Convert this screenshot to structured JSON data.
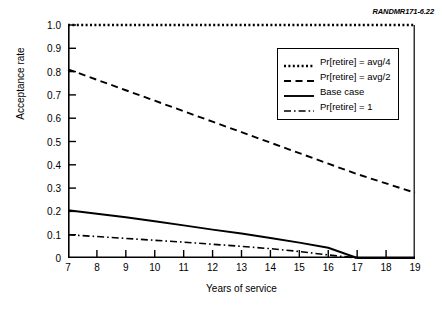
{
  "figure": {
    "source_id": "RANDMR171-6.22"
  },
  "chart_data": {
    "type": "line",
    "title": "",
    "xlabel": "Years of service",
    "ylabel": "Acceptance rate",
    "xlim": [
      7,
      19
    ],
    "ylim": [
      0,
      1.0
    ],
    "grid": false,
    "legend_position": "top-right-inside",
    "x": [
      7,
      8,
      9,
      10,
      11,
      12,
      13,
      14,
      15,
      16,
      17,
      18,
      19
    ],
    "xtick_labels": [
      "7",
      "8",
      "9",
      "10",
      "11",
      "12",
      "13",
      "14",
      "15",
      "16",
      "17",
      "18",
      "19"
    ],
    "ytick_values": [
      1.0,
      0.9,
      0.8,
      0.7,
      0.6,
      0.5,
      0.4,
      0.3,
      0.2,
      0.1,
      0
    ],
    "ytick_labels": [
      "1.0",
      "0.9",
      "0.8",
      "0.7",
      "0.6",
      "0.5",
      "0.4",
      "0.3",
      "0.2",
      "0.1",
      "0"
    ],
    "series": [
      {
        "name": "Pr[retire] = avg/4",
        "style": "dotted",
        "values": [
          1.0,
          1.0,
          1.0,
          1.0,
          1.0,
          1.0,
          1.0,
          1.0,
          1.0,
          1.0,
          1.0,
          1.0,
          1.0
        ]
      },
      {
        "name": "Pr[retire] = avg/2",
        "style": "dashed",
        "values": [
          0.81,
          0.765,
          0.72,
          0.675,
          0.63,
          0.585,
          0.54,
          0.495,
          0.45,
          0.405,
          0.36,
          0.32,
          0.28
        ]
      },
      {
        "name": "Base case",
        "style": "solid",
        "values": [
          0.205,
          0.19,
          0.175,
          0.158,
          0.14,
          0.122,
          0.105,
          0.086,
          0.066,
          0.044,
          0.0,
          0.0,
          0.0
        ]
      },
      {
        "name": "Pr[retire] = 1",
        "style": "dash-dot",
        "values": [
          0.1,
          0.092,
          0.084,
          0.076,
          0.068,
          0.059,
          0.05,
          0.04,
          0.028,
          0.013,
          0.0,
          0.0,
          0.0
        ]
      }
    ]
  },
  "legend": {
    "entries": [
      {
        "label": "Pr[retire] = avg/4",
        "style": "dotted"
      },
      {
        "label": "Pr[retire] = avg/2",
        "style": "dashed"
      },
      {
        "label": "Base case",
        "style": "solid"
      },
      {
        "label": "Pr[retire] = 1",
        "style": "dash-dot"
      }
    ]
  }
}
